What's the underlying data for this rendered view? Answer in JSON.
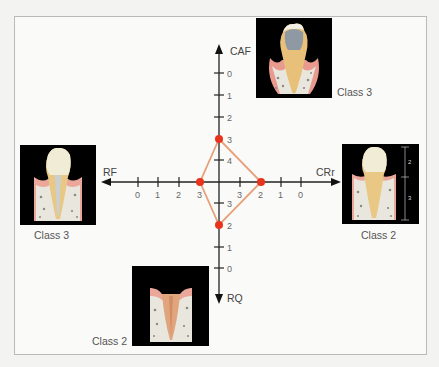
{
  "diagram": {
    "axes": {
      "CAF": {
        "label": "CAF",
        "direction": "up",
        "ticks": [
          "0",
          "1",
          "2",
          "3",
          "4"
        ]
      },
      "RQ": {
        "label": "RQ",
        "direction": "down",
        "ticks": [
          "3",
          "2",
          "1",
          "0"
        ]
      },
      "RF": {
        "label": "RF",
        "direction": "left",
        "ticks": [
          "0",
          "1",
          "2",
          "3"
        ]
      },
      "CRr": {
        "label": "CRr",
        "direction": "right",
        "ticks": [
          "3",
          "2",
          "1",
          "0"
        ]
      }
    },
    "points": {
      "CAF": 3,
      "RF": 3,
      "CRr": 2,
      "RQ": 2
    },
    "images": {
      "top": {
        "caption": "Class 3"
      },
      "left": {
        "caption": "Class 3"
      },
      "right": {
        "caption": "Class 2",
        "measure_top": "2",
        "measure_bottom": "3"
      },
      "bottom": {
        "caption": "Class 2"
      }
    },
    "colors": {
      "polygon": "#e8a07a",
      "point": "#e8341c",
      "axis": "#222222"
    }
  }
}
